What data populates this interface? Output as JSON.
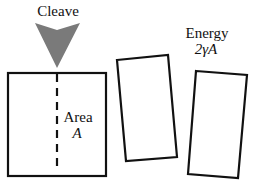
{
  "diagram": {
    "cleave_label": "Cleave",
    "area_label": "Area",
    "area_symbol": "A",
    "energy_label": "Energy",
    "energy_formula": "2γA",
    "colors": {
      "stroke": "#111111",
      "wedge": "#7a7a7a",
      "background": "#ffffff"
    }
  }
}
